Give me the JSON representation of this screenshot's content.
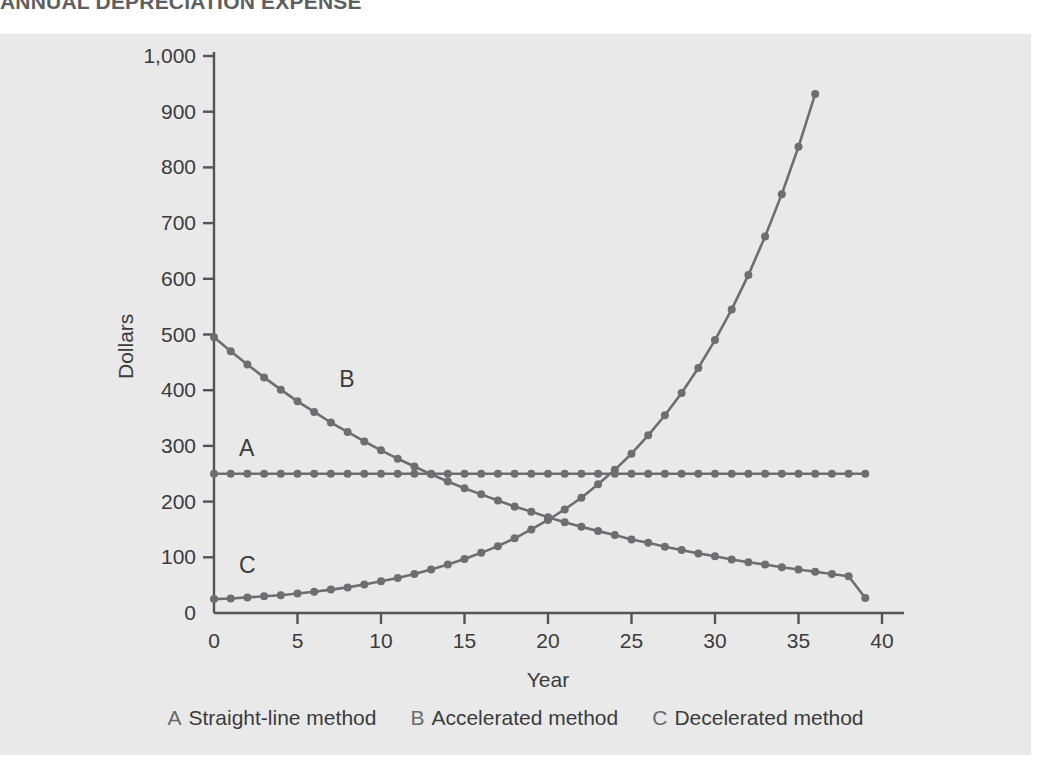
{
  "title": "ANNUAL DEPRECIATION EXPENSE",
  "colors": {
    "panel_background": "#e9e9e9",
    "page_background": "#ffffff",
    "axis": "#545456",
    "series": "#6e6e70",
    "text": "#3b3b3d",
    "title": "#5e5e60"
  },
  "axis": {
    "y_label": "Dollars",
    "x_label": "Year",
    "y_ticks": [
      "0",
      "100",
      "200",
      "300",
      "400",
      "500",
      "600",
      "700",
      "800",
      "900",
      "1,000"
    ],
    "x_ticks": [
      "0",
      "5",
      "10",
      "15",
      "20",
      "25",
      "30",
      "35",
      "40"
    ]
  },
  "series_tags": [
    {
      "name": "tag-a",
      "text": "A"
    },
    {
      "name": "tag-b",
      "text": "B"
    },
    {
      "name": "tag-c",
      "text": "C"
    }
  ],
  "legend": {
    "items": [
      {
        "key": "A",
        "label": "Straight-line method"
      },
      {
        "key": "B",
        "label": "Accelerated method"
      },
      {
        "key": "C",
        "label": "Decelerated method"
      }
    ]
  },
  "chart_data": {
    "type": "line",
    "title": "ANNUAL DEPRECIATION EXPENSE",
    "xlabel": "Year",
    "ylabel": "Dollars",
    "xlim": [
      0,
      40
    ],
    "ylim": [
      0,
      1000
    ],
    "grid": false,
    "legend_position": "bottom",
    "markers": true,
    "marker_interval_years": 1,
    "x": [
      0,
      1,
      2,
      3,
      4,
      5,
      6,
      7,
      8,
      9,
      10,
      11,
      12,
      13,
      14,
      15,
      16,
      17,
      18,
      19,
      20,
      21,
      22,
      23,
      24,
      25,
      26,
      27,
      28,
      29,
      30,
      31,
      32,
      33,
      34,
      35,
      36,
      37,
      38,
      39
    ],
    "series": [
      {
        "name": "A",
        "label": "Straight-line method",
        "values": [
          250,
          250,
          250,
          250,
          250,
          250,
          250,
          250,
          250,
          250,
          250,
          250,
          250,
          250,
          250,
          250,
          250,
          250,
          250,
          250,
          250,
          250,
          250,
          250,
          250,
          250,
          250,
          250,
          250,
          250,
          250,
          250,
          250,
          250,
          250,
          250,
          250,
          250,
          250,
          250
        ]
      },
      {
        "name": "B",
        "label": "Accelerated method",
        "values": [
          495,
          470,
          446,
          423,
          401,
          380,
          361,
          342,
          325,
          308,
          292,
          277,
          263,
          249,
          236,
          224,
          213,
          202,
          191,
          182,
          172,
          163,
          155,
          147,
          140,
          132,
          126,
          119,
          113,
          107,
          102,
          96,
          91,
          87,
          82,
          78,
          74,
          70,
          66,
          27
        ]
      },
      {
        "name": "C",
        "label": "Decelerated method",
        "values": [
          25,
          26,
          28,
          30,
          32,
          35,
          38,
          42,
          46,
          51,
          57,
          63,
          70,
          78,
          87,
          97,
          108,
          120,
          134,
          150,
          167,
          186,
          207,
          231,
          257,
          286,
          319,
          355,
          395,
          440,
          490,
          545,
          607,
          676,
          752,
          837,
          932,
          932,
          932,
          932
        ]
      }
    ],
    "annotations": [
      {
        "text": "A",
        "x": 1.5,
        "y": 290
      },
      {
        "text": "B",
        "x": 7.5,
        "y": 415
      },
      {
        "text": "C",
        "x": 1.5,
        "y": 80
      }
    ]
  }
}
